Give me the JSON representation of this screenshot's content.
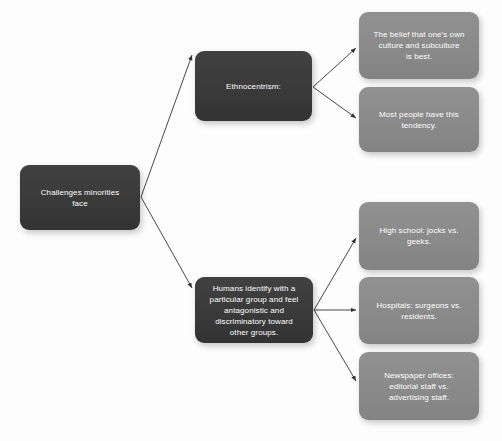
{
  "diagram": {
    "type": "flowchart",
    "title": "Challenges minorities face",
    "background_color": "#fdfdfd",
    "node_dark_color": "#3a3a3a",
    "node_light_color": "#8a8a8a",
    "edge_color": "#333333",
    "text_color": "#ffffff",
    "nodes": [
      {
        "id": "root",
        "label": "Challenges minorities\nface",
        "style": "dark",
        "x": 20,
        "y": 165,
        "w": 120,
        "h": 65
      },
      {
        "id": "ethnocentrism",
        "label": "Ethnocentrism:",
        "style": "dark",
        "x": 195,
        "y": 51,
        "w": 117,
        "h": 70
      },
      {
        "id": "belief",
        "label": "The belief that one's own\nculture and subculture\nis best.",
        "style": "light",
        "x": 359,
        "y": 12,
        "w": 120,
        "h": 67
      },
      {
        "id": "tendency",
        "label": "Most people have this\ntendency.",
        "style": "light",
        "x": 359,
        "y": 87,
        "w": 120,
        "h": 65
      },
      {
        "id": "ingroup",
        "label": "Humans identify with a\nparticular group and feel\nantagonistic and\ndiscriminatory toward\nother groups.",
        "style": "dark",
        "x": 195,
        "y": 277,
        "w": 118,
        "h": 66
      },
      {
        "id": "highschool",
        "label": "High school: jocks vs.\ngeeks.",
        "style": "light",
        "x": 359,
        "y": 202,
        "w": 120,
        "h": 68
      },
      {
        "id": "hospitals",
        "label": "Hospitals: surgeons vs.\nresidents.",
        "style": "light",
        "x": 359,
        "y": 277,
        "w": 120,
        "h": 67
      },
      {
        "id": "newspaper",
        "label": "Newspaper offices:\neditorial staff vs.\nadvertising staff.",
        "style": "light",
        "x": 359,
        "y": 352,
        "w": 120,
        "h": 68
      }
    ],
    "edges": [
      {
        "id": "root-to-ethnocentrism",
        "from": "root",
        "to": "ethnocentrism",
        "x1": 141,
        "y1": 197,
        "x2": 192,
        "y2": 55
      },
      {
        "id": "root-to-ingroup",
        "from": "root",
        "to": "ingroup",
        "x1": 141,
        "y1": 197,
        "x2": 192,
        "y2": 288
      },
      {
        "id": "ethnocentrism-to-belief",
        "from": "ethnocentrism",
        "to": "belief",
        "x1": 313,
        "y1": 87,
        "x2": 356,
        "y2": 48
      },
      {
        "id": "ethnocentrism-to-tendency",
        "from": "ethnocentrism",
        "to": "tendency",
        "x1": 313,
        "y1": 87,
        "x2": 356,
        "y2": 118
      },
      {
        "id": "ingroup-to-highschool",
        "from": "ingroup",
        "to": "highschool",
        "x1": 314,
        "y1": 310,
        "x2": 356,
        "y2": 238
      },
      {
        "id": "ingroup-to-hospitals",
        "from": "ingroup",
        "to": "hospitals",
        "x1": 314,
        "y1": 310,
        "x2": 356,
        "y2": 310
      },
      {
        "id": "ingroup-to-newspaper",
        "from": "ingroup",
        "to": "newspaper",
        "x1": 314,
        "y1": 310,
        "x2": 356,
        "y2": 381
      }
    ]
  }
}
